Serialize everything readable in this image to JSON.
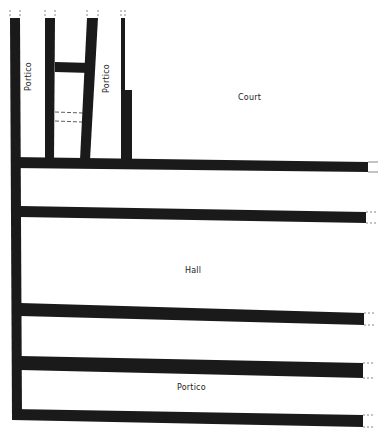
{
  "diagram": {
    "type": "architectural-floor-plan",
    "wall_color": "#1a1a1a",
    "background": "#ffffff",
    "labels": [
      {
        "id": "portico-left",
        "text": "Portico",
        "orientation": "vertical"
      },
      {
        "id": "portico-middle",
        "text": "Portico",
        "orientation": "vertical"
      },
      {
        "id": "court",
        "text": "Court",
        "orientation": "horizontal"
      },
      {
        "id": "hall",
        "text": "Hall",
        "orientation": "horizontal"
      },
      {
        "id": "portico-bottom",
        "text": "Portico",
        "orientation": "horizontal"
      }
    ]
  }
}
